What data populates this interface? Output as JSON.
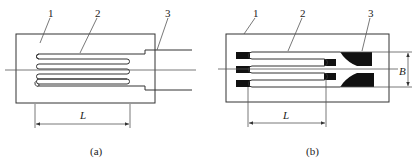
{
  "figures": [
    {
      "id": "a",
      "caption": "(a)",
      "title": "Wire strain gauge",
      "callouts": [
        {
          "number": "1",
          "part": "substrate"
        },
        {
          "number": "2",
          "part": "sensitive grid"
        },
        {
          "number": "3",
          "part": "lead wire"
        }
      ],
      "dimensions": [
        {
          "symbol": "L",
          "meaning": "grid length"
        }
      ]
    },
    {
      "id": "b",
      "caption": "(b)",
      "title": "Foil strain gauge",
      "callouts": [
        {
          "number": "1",
          "part": "substrate"
        },
        {
          "number": "2",
          "part": "sensitive grid"
        },
        {
          "number": "3",
          "part": "lead tab"
        }
      ],
      "dimensions": [
        {
          "symbol": "L",
          "meaning": "grid length"
        },
        {
          "symbol": "B",
          "meaning": "grid width"
        }
      ]
    }
  ],
  "colors": {
    "line": "#333333",
    "fill": "#111111",
    "background": "#ffffff"
  }
}
